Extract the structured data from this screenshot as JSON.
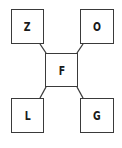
{
  "diagram": {
    "type": "star",
    "center": {
      "id": "F",
      "label": "F"
    },
    "nodes": [
      {
        "id": "Z",
        "label": "Z",
        "position": "top-left"
      },
      {
        "id": "O",
        "label": "O",
        "position": "top-right"
      },
      {
        "id": "L",
        "label": "L",
        "position": "bottom-left"
      },
      {
        "id": "G",
        "label": "G",
        "position": "bottom-right"
      }
    ],
    "edges": [
      {
        "from": "F",
        "to": "Z"
      },
      {
        "from": "F",
        "to": "O"
      },
      {
        "from": "F",
        "to": "L"
      },
      {
        "from": "F",
        "to": "G"
      }
    ],
    "colors": {
      "stroke": "#3a3a3a",
      "fill": "#ffffff",
      "text": "#1a1a1a"
    }
  }
}
